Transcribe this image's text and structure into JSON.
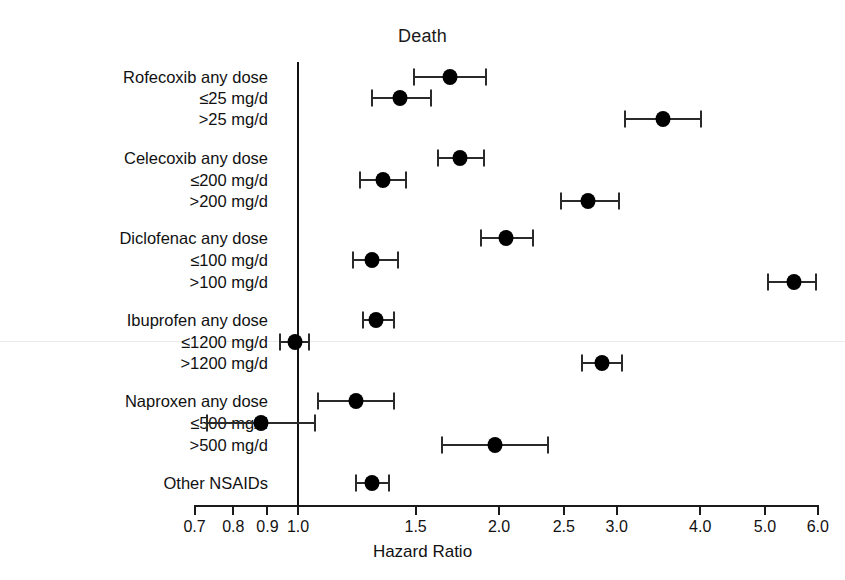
{
  "chart_data": {
    "type": "scatter",
    "plot_style": "forest-plot",
    "title": "Death",
    "xlabel": "Hazard Ratio",
    "ylabel": "",
    "xscale": "log",
    "xlim": [
      0.7,
      6.0
    ],
    "grid": false,
    "legend": null,
    "reference_line": 1.0,
    "xticks": [
      0.7,
      0.8,
      0.9,
      1.0,
      1.5,
      2.0,
      2.5,
      3.0,
      4.0,
      5.0,
      6.0
    ],
    "xtick_labels": [
      "0.7",
      "0.8",
      "0.9",
      "1.0",
      "1.5",
      "2.0",
      "2.5",
      "3.0",
      "4.0",
      "5.0",
      "6.0"
    ],
    "categories": [
      "Rofecoxib any dose",
      "≤25 mg/d",
      ">25 mg/d",
      "Celecoxib any dose",
      "≤200 mg/d",
      ">200 mg/d",
      "Diclofenac any dose",
      "≤100 mg/d",
      ">100 mg/d",
      "Ibuprofen any dose",
      "≤1200 mg/d",
      ">1200 mg/d",
      "Naproxen any dose",
      "≤500 mg/d",
      ">500 mg/d",
      "Other NSAIDs"
    ],
    "values": [
      1.69,
      1.42,
      3.52,
      1.75,
      1.34,
      2.72,
      2.05,
      1.29,
      5.53,
      1.31,
      0.99,
      2.85,
      1.22,
      0.88,
      1.97,
      1.29
    ],
    "ci_low": [
      1.49,
      1.29,
      3.09,
      1.62,
      1.24,
      2.48,
      1.88,
      1.21,
      5.06,
      1.25,
      0.94,
      2.66,
      1.07,
      0.73,
      1.64,
      1.22
    ],
    "ci_high": [
      1.91,
      1.58,
      4.01,
      1.9,
      1.45,
      3.02,
      2.25,
      1.41,
      5.97,
      1.39,
      1.04,
      3.06,
      1.39,
      1.06,
      2.37,
      1.37
    ],
    "rows": [
      {
        "label": "Rofecoxib any dose",
        "indent": 0,
        "group_start": true,
        "hr": 1.69,
        "lo": 1.49,
        "hi": 1.91,
        "y": 77
      },
      {
        "label": "≤25 mg/d",
        "indent": 1,
        "group_start": false,
        "hr": 1.42,
        "lo": 1.29,
        "hi": 1.58,
        "y": 98
      },
      {
        "label": ">25 mg/d",
        "indent": 1,
        "group_start": false,
        "hr": 3.52,
        "lo": 3.09,
        "hi": 4.01,
        "y": 119
      },
      {
        "label": "Celecoxib any dose",
        "indent": 0,
        "group_start": true,
        "hr": 1.75,
        "lo": 1.62,
        "hi": 1.9,
        "y": 158
      },
      {
        "label": "≤200 mg/d",
        "indent": 1,
        "group_start": false,
        "hr": 1.34,
        "lo": 1.24,
        "hi": 1.45,
        "y": 180
      },
      {
        "label": ">200 mg/d",
        "indent": 1,
        "group_start": false,
        "hr": 2.72,
        "lo": 2.48,
        "hi": 3.02,
        "y": 201
      },
      {
        "label": "Diclofenac any dose",
        "indent": 0,
        "group_start": true,
        "hr": 2.05,
        "lo": 1.88,
        "hi": 2.25,
        "y": 238
      },
      {
        "label": "≤100 mg/d",
        "indent": 1,
        "group_start": false,
        "hr": 1.29,
        "lo": 1.21,
        "hi": 1.41,
        "y": 260
      },
      {
        "label": ">100 mg/d",
        "indent": 1,
        "group_start": false,
        "hr": 5.53,
        "lo": 5.06,
        "hi": 5.97,
        "y": 282
      },
      {
        "label": "Ibuprofen any dose",
        "indent": 0,
        "group_start": true,
        "hr": 1.31,
        "lo": 1.25,
        "hi": 1.39,
        "y": 320
      },
      {
        "label": "≤1200 mg/d",
        "indent": 1,
        "group_start": false,
        "hr": 0.99,
        "lo": 0.94,
        "hi": 1.04,
        "y": 342
      },
      {
        "label": ">1200 mg/d",
        "indent": 1,
        "group_start": false,
        "hr": 2.85,
        "lo": 2.66,
        "hi": 3.06,
        "y": 363
      },
      {
        "label": "Naproxen any dose",
        "indent": 0,
        "group_start": true,
        "hr": 1.22,
        "lo": 1.07,
        "hi": 1.39,
        "y": 401
      },
      {
        "label": "≤500 mg/d",
        "indent": 1,
        "group_start": false,
        "hr": 0.88,
        "lo": 0.73,
        "hi": 1.06,
        "y": 423
      },
      {
        "label": ">500 mg/d",
        "indent": 1,
        "group_start": false,
        "hr": 1.97,
        "lo": 1.64,
        "hi": 2.37,
        "y": 445
      },
      {
        "label": "Other NSAIDs",
        "indent": 0,
        "group_start": true,
        "hr": 1.29,
        "lo": 1.22,
        "hi": 1.37,
        "y": 483
      }
    ]
  },
  "figure": {
    "title": "Death",
    "axis_title": "Hazard Ratio",
    "marker_color": "#000000",
    "line_color": "#2a2a2a",
    "background": "#ffffff"
  },
  "geometry": {
    "axis_y": 505,
    "axis_x_left": 194,
    "axis_x_right": 819,
    "null_x": 298,
    "px_per_decade": 668,
    "null_line_top": 62,
    "null_line_bottom": 505,
    "label_right_edge": 268,
    "faint_rule_y": 341
  }
}
